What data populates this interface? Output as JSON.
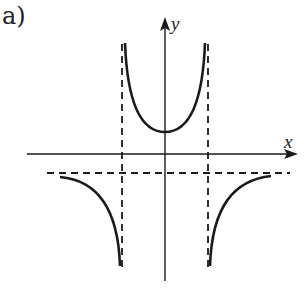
{
  "part_label": "a)",
  "axes": {
    "x_label": "x",
    "y_label": "y"
  },
  "colors": {
    "ink": "#1a1a1a",
    "background": "#ffffff"
  },
  "graph": {
    "description": "Graph of a rational function with two vertical asymptotes and one horizontal asymptote below the x-axis; U-shaped branch between the vertical asymptotes opening upward with minimum above x-axis; two outer branches below the horizontal asymptote going down toward the vertical asymptotes.",
    "vertical_asymptotes": [
      "x = -a",
      "x = a"
    ],
    "horizontal_asymptote": "y = -c (below x-axis)",
    "branches": [
      "left-lower",
      "middle-U",
      "right-lower"
    ]
  }
}
